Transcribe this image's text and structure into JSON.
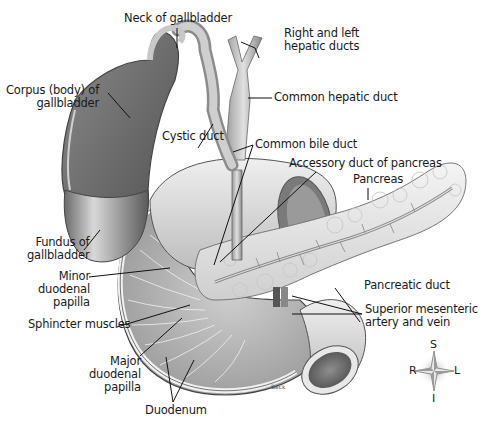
{
  "figure": {
    "signature": "Beck"
  },
  "labels": {
    "neck_of_gallbladder": "Neck of gallbladder",
    "right_left_hepatic_ducts": "Right and left\nhepatic ducts",
    "corpus_of_gallbladder": "Corpus (body) of\ngallbladder",
    "common_hepatic_duct": "Common hepatic duct",
    "cystic_duct": "Cystic duct",
    "common_bile_duct": "Common bile duct",
    "accessory_duct": "Accessory duct of pancreas",
    "pancreas": "Pancreas",
    "fundus_of_gallbladder": "Fundus of\ngallbladder",
    "minor_duodenal_papilla": "Minor\nduodenal\npapilla",
    "pancreatic_duct": "Pancreatic duct",
    "sphincter_muscles": "Sphincter muscles",
    "superior_mesenteric": "Superior mesenteric\nartery and vein",
    "major_duodenal_papilla": "Major\nduodenal\npapilla",
    "duodenum": "Duodenum"
  },
  "compass": {
    "superior": "S",
    "inferior": "I",
    "right": "R",
    "left": "L"
  }
}
